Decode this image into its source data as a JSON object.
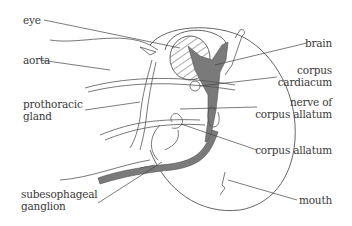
{
  "diagram": {
    "colors": {
      "line": "#555555",
      "fill_nerve": "#7a7a7a",
      "text": "#3a3a3a",
      "background": "#ffffff"
    },
    "labels_left": [
      {
        "id": "eye",
        "lines": [
          "eye"
        ]
      },
      {
        "id": "aorta",
        "lines": [
          "aorta"
        ]
      },
      {
        "id": "prothoracic-gland",
        "lines": [
          "prothoracic",
          "gland"
        ]
      },
      {
        "id": "subesophageal-ganglion",
        "lines": [
          "subesophageal",
          "ganglion"
        ]
      }
    ],
    "labels_right": [
      {
        "id": "brain",
        "lines": [
          "brain"
        ]
      },
      {
        "id": "corpus-cardiacum",
        "lines": [
          "corpus",
          "cardiacum"
        ]
      },
      {
        "id": "nerve-of-corpus-allatum",
        "lines": [
          "nerve of",
          "corpus allatum"
        ]
      },
      {
        "id": "corpus-allatum",
        "lines": [
          "corpus allatum"
        ]
      },
      {
        "id": "mouth",
        "lines": [
          "mouth"
        ]
      }
    ]
  }
}
